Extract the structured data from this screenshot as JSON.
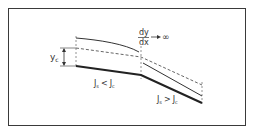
{
  "diagram": {
    "derivative_label": {
      "numerator": "dy",
      "denominator": "dx",
      "arrow": "→",
      "limit": "∞"
    },
    "critical_depth_label": {
      "base": "y",
      "sub": "c"
    },
    "mild_slope_label": {
      "left": "J",
      "left_sub": "s",
      "op": "<",
      "right": "J",
      "right_sub": "c"
    },
    "steep_slope_label": {
      "left": "J",
      "left_sub": "s",
      "op": ">",
      "right": "J",
      "right_sub": "c"
    },
    "colors": {
      "line": "#333333",
      "bed": "#222222",
      "dashed": "#555555",
      "frame": "#3a3a3a"
    }
  }
}
